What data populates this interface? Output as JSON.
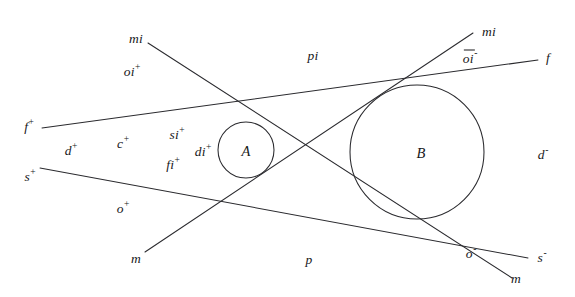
{
  "figure": {
    "type": "geometric-diagram",
    "background": "#ffffff",
    "stroke_color": "#2a2a2e",
    "width": 575,
    "height": 297
  },
  "circles": [
    {
      "id": "A",
      "label": "A",
      "cx": 246,
      "cy": 150,
      "r": 28,
      "label_x": 246,
      "label_y": 151
    },
    {
      "id": "B",
      "label": "B",
      "cx": 417,
      "cy": 152,
      "r": 67,
      "label_x": 421,
      "label_y": 153
    }
  ],
  "lines": [
    {
      "id": "f",
      "name": "tangent-f",
      "x1": 42,
      "y1": 128,
      "x2": 538,
      "y2": 60
    },
    {
      "id": "s",
      "name": "tangent-s",
      "x1": 40,
      "y1": 168,
      "x2": 528,
      "y2": 258
    },
    {
      "id": "mi1",
      "name": "line-mi-descending",
      "x1": 148,
      "y1": 43,
      "x2": 512,
      "y2": 278
    },
    {
      "id": "mi2",
      "name": "line-mi-ascending",
      "x1": 145,
      "y1": 252,
      "x2": 473,
      "y2": 33
    }
  ],
  "labels": [
    {
      "id": "mi-top-left",
      "text": "mi",
      "x": 136,
      "y": 39,
      "sup": ""
    },
    {
      "id": "oi-plus",
      "text": "oi",
      "x": 132,
      "y": 71,
      "sup": "+"
    },
    {
      "id": "pi",
      "text": "pi",
      "x": 313,
      "y": 56,
      "sup": ""
    },
    {
      "id": "mi-top-right",
      "text": "mi",
      "x": 489,
      "y": 32,
      "sup": ""
    },
    {
      "id": "oi-minus",
      "text": "oi",
      "x": 470,
      "y": 57,
      "sup": "-",
      "overline": true
    },
    {
      "id": "f-right",
      "text": "f",
      "x": 548,
      "y": 58,
      "sup": ""
    },
    {
      "id": "f-plus",
      "text": "f",
      "x": 29,
      "y": 126,
      "sup": "+"
    },
    {
      "id": "d-plus",
      "text": "d",
      "x": 71,
      "y": 150,
      "sup": "+"
    },
    {
      "id": "c-plus",
      "text": "c",
      "x": 123,
      "y": 143,
      "sup": "+"
    },
    {
      "id": "si-plus",
      "text": "si",
      "x": 177,
      "y": 134,
      "sup": "+"
    },
    {
      "id": "di-plus",
      "text": "di",
      "x": 203,
      "y": 151,
      "sup": "+"
    },
    {
      "id": "fi-plus",
      "text": "fi",
      "x": 173,
      "y": 164,
      "sup": "+"
    },
    {
      "id": "s-plus",
      "text": "s",
      "x": 30,
      "y": 176,
      "sup": "+"
    },
    {
      "id": "d-minus",
      "text": "d",
      "x": 543,
      "y": 154,
      "sup": "-"
    },
    {
      "id": "o-plus",
      "text": "o",
      "x": 123,
      "y": 208,
      "sup": "+"
    },
    {
      "id": "m-bottom-left",
      "text": "m",
      "x": 136,
      "y": 259,
      "sup": ""
    },
    {
      "id": "p",
      "text": "p",
      "x": 309,
      "y": 260,
      "sup": ""
    },
    {
      "id": "o-minus",
      "text": "o",
      "x": 471,
      "y": 253,
      "sup": "-"
    },
    {
      "id": "s-minus",
      "text": "s",
      "x": 542,
      "y": 257,
      "sup": "-"
    },
    {
      "id": "m-bottom-right",
      "text": "m",
      "x": 516,
      "y": 279,
      "sup": ""
    }
  ]
}
